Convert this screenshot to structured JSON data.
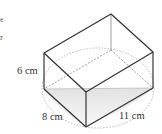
{
  "diagram": {
    "type": "rectangular prism (cuboid) with hidden edges and inscribed base circle",
    "labels": {
      "height": "6 cm",
      "depth": "8 cm",
      "width": "11 cm"
    },
    "left_edge_fragments": [
      "e",
      "n"
    ],
    "colors": {
      "edge": "#333333",
      "hidden_edge": "#888888",
      "circle": "#aaaaaa",
      "shade": "#e6e6e6"
    }
  }
}
